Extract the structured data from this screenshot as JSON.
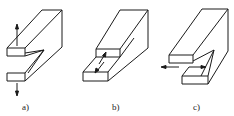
{
  "figure": {
    "line_color": "#1a1a1a",
    "background": "#ffffff"
  },
  "panels": [
    {
      "label": "a)",
      "mode": "opening (tension perpendicular to crack plane)",
      "arrows": "vertical, up and down"
    },
    {
      "label": "b)",
      "mode": "sliding (in-plane shear)",
      "arrows": "along block length, opposite directions"
    },
    {
      "label": "c)",
      "mode": "tearing (out-of-plane shear)",
      "arrows": "horizontal, left and right"
    }
  ]
}
